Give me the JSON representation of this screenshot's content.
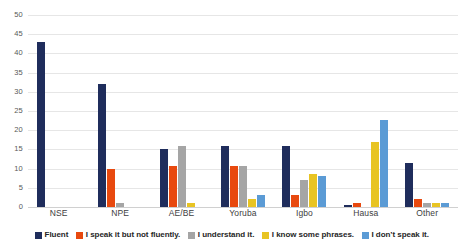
{
  "chart_data": {
    "type": "bar",
    "title": "",
    "subtitle": "",
    "xlabel": "",
    "ylabel": "",
    "ylim": [
      0,
      50
    ],
    "ytick_step": 5,
    "yticks": [
      0,
      5,
      10,
      15,
      20,
      25,
      30,
      35,
      40,
      45,
      50
    ],
    "grid": true,
    "legend_position": "bottom",
    "categories": [
      "NSE",
      "NPE",
      "AE/BE",
      "Yoruba",
      "Igbo",
      "Hausa",
      "Other"
    ],
    "series": [
      {
        "name": "Fluent",
        "color": "#1F2D5C",
        "values": [
          43,
          32,
          15,
          16,
          16,
          0.5,
          11.5
        ]
      },
      {
        "name": "I speak it but not fluently.",
        "color": "#E8490F",
        "values": [
          0,
          10,
          10.7,
          10.7,
          3,
          1,
          2
        ]
      },
      {
        "name": "I understand it.",
        "color": "#A5A5A5",
        "values": [
          0,
          1,
          16,
          10.7,
          7,
          0,
          1
        ]
      },
      {
        "name": "I know some phrases.",
        "color": "#E8C423",
        "values": [
          0,
          0,
          1,
          2,
          8.7,
          17,
          1
        ]
      },
      {
        "name": "I don't speak it.",
        "color": "#5B9BD5",
        "values": [
          0,
          0,
          0,
          3,
          8,
          22.7,
          1
        ]
      }
    ]
  },
  "legend": {
    "items": [
      {
        "label": "Fluent",
        "color": "#1F2D5C"
      },
      {
        "label": "I speak it but not fluently.",
        "color": "#E8490F"
      },
      {
        "label": "I understand it.",
        "color": "#A5A5A5"
      },
      {
        "label": "I know some phrases.",
        "color": "#E8C423"
      },
      {
        "label": "I don’t speak it.",
        "color": "#5B9BD5"
      }
    ]
  }
}
